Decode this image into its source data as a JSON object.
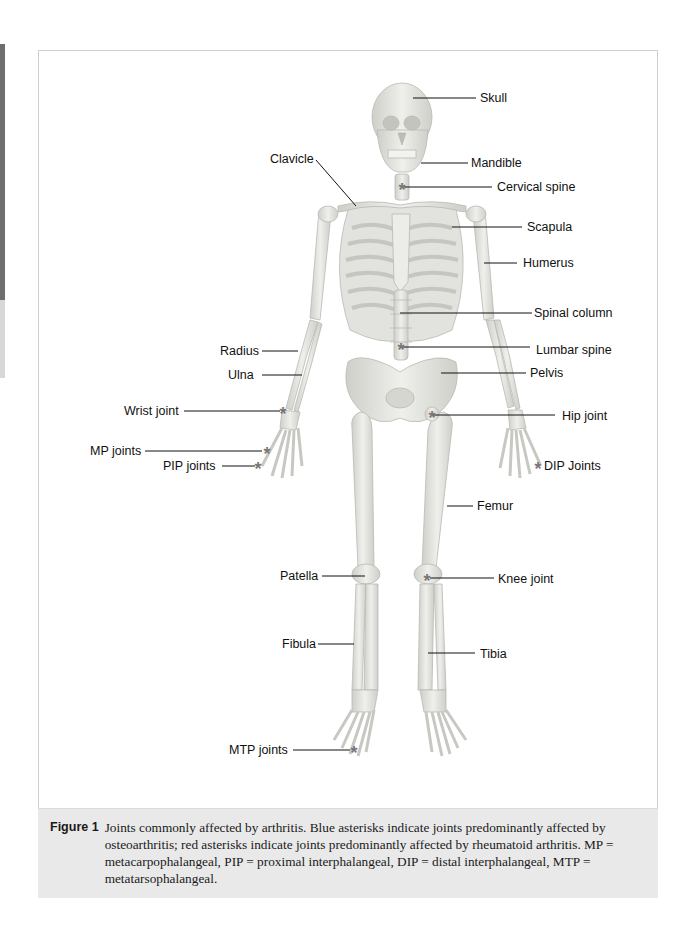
{
  "figure": {
    "number_label": "Figure 1",
    "caption": "Joints commonly affected by arthritis. Blue asterisks indicate joints predominantly affected by osteoarthritis; red asterisks indicate joints predominantly affected by rheumatoid arthritis. MP = metacarpophalangeal, PIP = proximal interphalangeal, DIP = distal interphalangeal, MTP = metatarsophalangeal."
  },
  "colors": {
    "bone": "#e6e6e2",
    "bone_edge": "#bdbdb8",
    "asterisk": "#777777",
    "leader_line": "#111111",
    "caption_bg": "#e9e9e9"
  },
  "labels": {
    "skull": "Skull",
    "clavicle": "Clavicle",
    "mandible": "Mandible",
    "cervical_spine": "Cervical spine",
    "scapula": "Scapula",
    "humerus": "Humerus",
    "spinal_column": "Spinal column",
    "radius": "Radius",
    "lumbar_spine": "Lumbar spine",
    "ulna": "Ulna",
    "pelvis": "Pelvis",
    "wrist_joint": "Wrist joint",
    "hip_joint": "Hip joint",
    "mp_joints": "MP joints",
    "pip_joints": "PIP joints",
    "dip_joints": "DIP Joints",
    "femur": "Femur",
    "patella": "Patella",
    "knee_joint": "Knee joint",
    "fibula": "Fibula",
    "tibia": "Tibia",
    "mtp_joints": "MTP joints"
  },
  "asterisk_symbol": "*"
}
